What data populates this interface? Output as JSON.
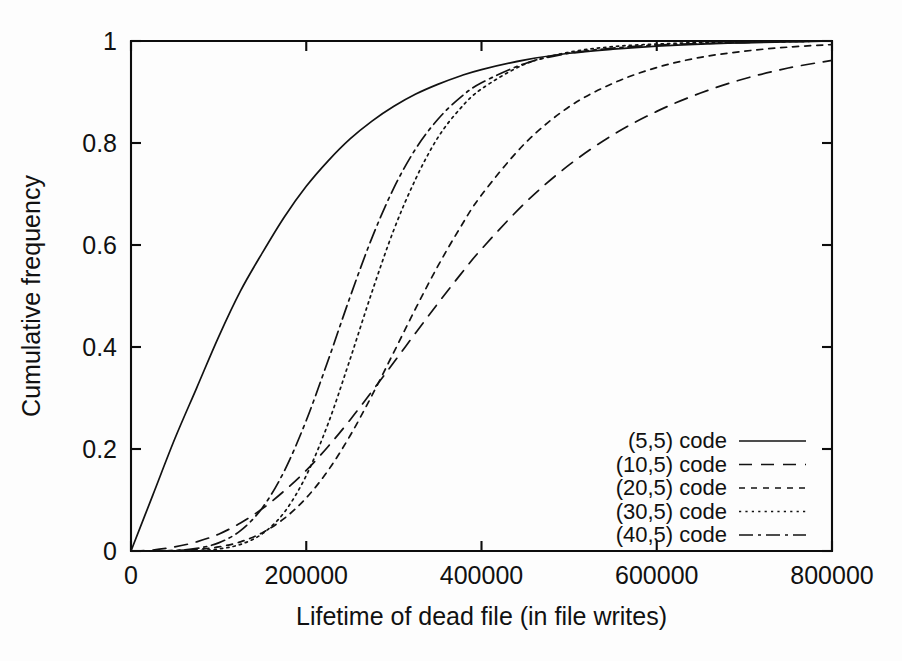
{
  "figure": {
    "background_color": "#fdfdfd",
    "ink_color": "#121212"
  },
  "axes": {
    "x_axis_label": "Lifetime of dead file (in file writes)",
    "y_axis_label": "Cumulative frequency",
    "x_tick_labels": [
      "0",
      "200000",
      "400000",
      "600000",
      "800000"
    ],
    "y_tick_labels": [
      "0",
      "0.2",
      "0.4",
      "0.6",
      "0.8",
      "1"
    ]
  },
  "legend": {
    "entries": [
      {
        "label": "(5,5) code",
        "style": "solid"
      },
      {
        "label": "(10,5) code",
        "style": "dashed"
      },
      {
        "label": "(20,5) code",
        "style": "short-dash"
      },
      {
        "label": "(30,5) code",
        "style": "dotted"
      },
      {
        "label": "(40,5) code",
        "style": "dash-dot"
      }
    ]
  },
  "chart_data": {
    "type": "line",
    "title": "",
    "xlabel": "Lifetime of dead file (in file writes)",
    "ylabel": "Cumulative frequency",
    "xlim": [
      0,
      800000
    ],
    "ylim": [
      0,
      1
    ],
    "xticks": [
      0,
      200000,
      400000,
      600000,
      800000
    ],
    "yticks": [
      0,
      0.2,
      0.4,
      0.6,
      0.8,
      1
    ],
    "grid": false,
    "legend_position": "lower-right",
    "x": [
      0,
      25000,
      50000,
      75000,
      100000,
      125000,
      150000,
      175000,
      200000,
      225000,
      250000,
      275000,
      300000,
      325000,
      350000,
      375000,
      400000,
      450000,
      500000,
      550000,
      600000,
      650000,
      700000,
      750000,
      800000
    ],
    "series": [
      {
        "name": "(5,5) code",
        "dash": "solid",
        "values": [
          0.0,
          0.11,
          0.22,
          0.32,
          0.42,
          0.51,
          0.585,
          0.655,
          0.715,
          0.765,
          0.808,
          0.843,
          0.872,
          0.896,
          0.915,
          0.931,
          0.944,
          0.963,
          0.976,
          0.984,
          0.99,
          0.994,
          0.9965,
          0.998,
          1.0
        ]
      },
      {
        "name": "(10,5) code",
        "dash": "dashed",
        "values": [
          0.0,
          0.002,
          0.008,
          0.018,
          0.033,
          0.055,
          0.083,
          0.118,
          0.158,
          0.205,
          0.257,
          0.313,
          0.37,
          0.428,
          0.485,
          0.54,
          0.592,
          0.683,
          0.757,
          0.816,
          0.862,
          0.898,
          0.926,
          0.947,
          0.962
        ]
      },
      {
        "name": "(20,5) code",
        "dash": "short-dash",
        "values": [
          0.0,
          0.0,
          0.001,
          0.003,
          0.008,
          0.018,
          0.036,
          0.064,
          0.104,
          0.158,
          0.226,
          0.305,
          0.39,
          0.476,
          0.558,
          0.632,
          0.698,
          0.8,
          0.871,
          0.917,
          0.948,
          0.968,
          0.98,
          0.988,
          0.993
        ]
      },
      {
        "name": "(30,5) code",
        "dash": "dotted",
        "values": [
          0.0,
          0.0,
          0.0,
          0.001,
          0.004,
          0.013,
          0.034,
          0.076,
          0.148,
          0.25,
          0.376,
          0.508,
          0.63,
          0.73,
          0.81,
          0.866,
          0.906,
          0.955,
          0.978,
          0.989,
          0.994,
          0.997,
          0.998,
          0.999,
          1.0
        ]
      },
      {
        "name": "(40,5) code",
        "dash": "dash-dot",
        "values": [
          0.0,
          0.0,
          0.001,
          0.005,
          0.016,
          0.04,
          0.085,
          0.157,
          0.256,
          0.374,
          0.498,
          0.614,
          0.712,
          0.789,
          0.846,
          0.888,
          0.918,
          0.956,
          0.976,
          0.986,
          0.992,
          0.995,
          0.997,
          0.999,
          1.0
        ]
      }
    ]
  }
}
